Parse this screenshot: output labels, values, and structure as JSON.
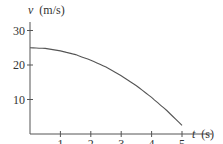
{
  "chart_data": {
    "type": "line",
    "title": "",
    "xlabel": "t (s)",
    "ylabel": "v (m/s)",
    "xlabel_var": "t",
    "xlabel_unit": "(s)",
    "ylabel_var": "v",
    "ylabel_unit": "(m/s)",
    "xlim": [
      0,
      5
    ],
    "ylim": [
      0,
      30
    ],
    "x_ticks": [
      1,
      2,
      3,
      4,
      5
    ],
    "y_ticks": [
      10,
      20,
      30
    ],
    "grid": false,
    "legend": null,
    "series": [
      {
        "name": "velocity",
        "x": [
          0,
          0.5,
          1,
          1.5,
          2,
          2.5,
          3,
          3.5,
          4,
          4.5,
          5
        ],
        "values": [
          25,
          24.8,
          24.1,
          23,
          21.4,
          19.4,
          16.9,
          14,
          10.6,
          6.8,
          2.5
        ]
      }
    ],
    "color": "#555555"
  }
}
